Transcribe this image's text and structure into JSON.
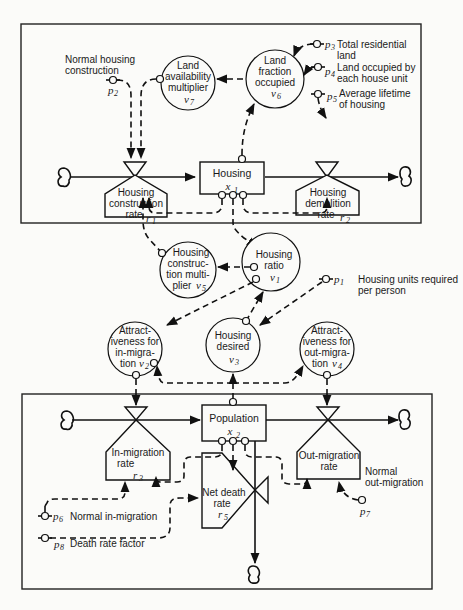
{
  "diagram": {
    "type": "system-dynamics-flow-diagram",
    "sectors": [
      "housing",
      "population"
    ]
  },
  "levels": {
    "housing": {
      "name": "Housing",
      "symbol": "x",
      "index": "1"
    },
    "population": {
      "name": "Population",
      "symbol": "x",
      "index": "2"
    }
  },
  "rates": {
    "r1": {
      "line1": "Housing",
      "line2": "construction",
      "line3": "rate",
      "symbol": "r",
      "index": "1"
    },
    "r2": {
      "line1": "Housing",
      "line2": "demolition",
      "line3": "rate",
      "symbol": "r",
      "index": "2"
    },
    "r3": {
      "line1": "In-migration",
      "line2": "rate",
      "symbol": "r",
      "index": "3"
    },
    "r4": {
      "line1": "Out-migration",
      "line2": "rate"
    },
    "r5": {
      "line1": "Net death",
      "line2": "rate",
      "symbol": "r",
      "index": "5"
    }
  },
  "auxiliaries": {
    "v1": {
      "line1": "Housing",
      "line2": "ratio",
      "symbol": "v",
      "index": "1"
    },
    "v2": {
      "line1": "Attract-",
      "line2": "iveness for",
      "line3": "in-migra-",
      "line4": "tion",
      "symbol": "v",
      "index": "2"
    },
    "v3": {
      "line1": "Housing",
      "line2": "desired",
      "symbol": "v",
      "index": "3"
    },
    "v4": {
      "line1": "Attract-",
      "line2": "iveness for",
      "line3": "out-migra-",
      "line4": "tion",
      "symbol": "v",
      "index": "4"
    },
    "v5": {
      "line1": "Housing",
      "line2": "construc-",
      "line3": "tion multi-",
      "line4": "plier",
      "symbol": "v",
      "index": "5"
    },
    "v6": {
      "line1": "Land",
      "line2": "fraction",
      "line3": "occupied",
      "symbol": "v",
      "index": "6"
    },
    "v7": {
      "line1": "Land",
      "line2": "availability",
      "line3": "multiplier",
      "symbol": "v",
      "index": "7"
    }
  },
  "parameters": {
    "p1": {
      "symbol": "p",
      "index": "1",
      "line1": "Housing units required",
      "line2": "per person"
    },
    "p2": {
      "symbol": "p",
      "index": "2",
      "line1": "Normal housing",
      "line2": "construction"
    },
    "p3": {
      "symbol": "p",
      "index": "3",
      "line1": "Total residential",
      "line2": "land"
    },
    "p4": {
      "symbol": "p",
      "index": "4",
      "line1": "Land occupied by",
      "line2": "each house unit"
    },
    "p5": {
      "symbol": "p",
      "index": "5",
      "line1": "Average lifetime",
      "line2": "of housing"
    },
    "p6": {
      "symbol": "p",
      "index": "6",
      "line1": "Normal in-migration"
    },
    "p7": {
      "symbol": "p",
      "index": "7",
      "line1": "Normal",
      "line2": "out-migration"
    },
    "p8": {
      "symbol": "p",
      "index": "8",
      "line1": "Death rate factor"
    }
  }
}
